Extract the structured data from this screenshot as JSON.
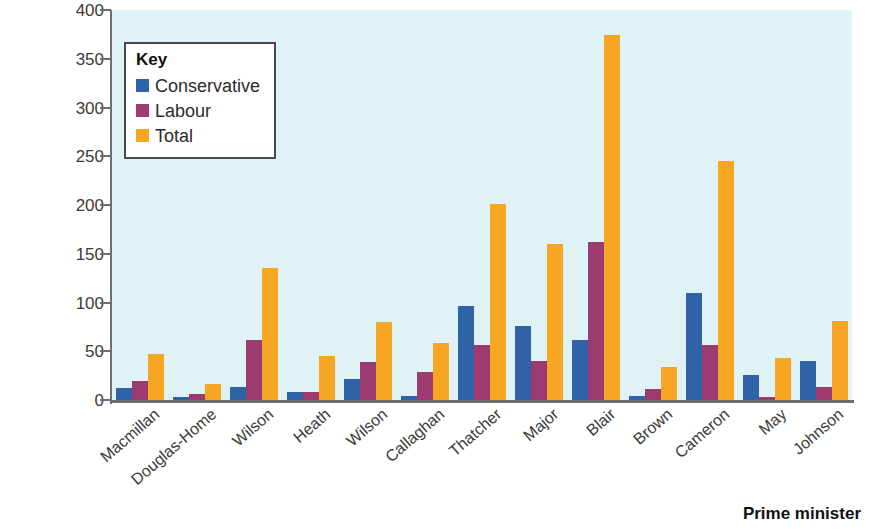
{
  "chart_data": {
    "type": "bar",
    "title": "",
    "xlabel": "Prime minister",
    "ylabel": "Number of life peerages",
    "ylim": [
      0,
      400
    ],
    "ytick_labels": [
      "400",
      "350",
      "300",
      "250",
      "200",
      "150",
      "100",
      "50",
      "0"
    ],
    "ytick_values": [
      400,
      350,
      300,
      250,
      200,
      150,
      100,
      50,
      0
    ],
    "grid": false,
    "legend_position": "top-left",
    "legend_title": "Key",
    "categories": [
      "Macmillan",
      "Douglas-Home",
      "Wilson",
      "Heath",
      "Wilson",
      "Callaghan",
      "Thatcher",
      "Major",
      "Blair",
      "Brown",
      "Cameron",
      "May",
      "Johnson"
    ],
    "series": [
      {
        "name": "Conservative",
        "color": "#2f62a6",
        "values": [
          12,
          3,
          13,
          8,
          22,
          4,
          96,
          76,
          62,
          4,
          110,
          26,
          40
        ]
      },
      {
        "name": "Labour",
        "color": "#9c3b70",
        "values": [
          20,
          6,
          62,
          8,
          39,
          29,
          56,
          40,
          162,
          11,
          56,
          3,
          13
        ]
      },
      {
        "name": "Total",
        "color": "#f6a623",
        "values": [
          47,
          16,
          135,
          45,
          80,
          58,
          201,
          160,
          374,
          34,
          245,
          43,
          81
        ]
      }
    ]
  },
  "axes": {
    "y_title": "Number of life peerages",
    "x_title": "Prime minister"
  },
  "colors": {
    "conservative": "#2f62a6",
    "labour": "#9c3b70",
    "total": "#f6a623",
    "plot_background": "#dff3f7",
    "axis": "#6e6e6e",
    "page_background": "#ffffff"
  }
}
